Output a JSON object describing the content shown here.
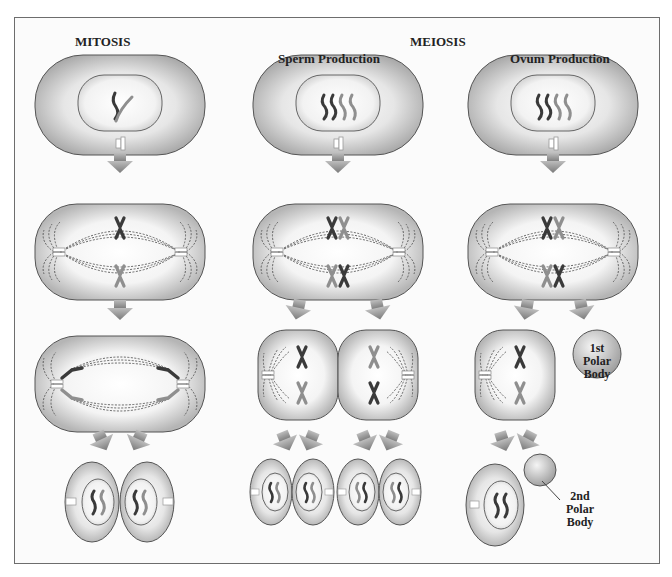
{
  "headers": {
    "mitosis": "MITOSIS",
    "meiosis": "MEIOSIS",
    "sperm": "Sperm Production",
    "ovum": "Ovum Production"
  },
  "labels": {
    "first_polar_body": [
      "1st",
      "Polar",
      "Body"
    ],
    "second_polar_body": [
      "2nd",
      "Polar",
      "Body"
    ]
  },
  "colors": {
    "border": "#6d6d6d",
    "cell_fill_edge": "#a8a8a8",
    "cell_fill_center": "#ffffff",
    "arrow": "#8a8a8a",
    "chromosome_dark": "#3a3a3a",
    "chromosome_light": "#8f8f8f"
  },
  "columns": [
    {
      "name": "mitosis",
      "stages": [
        "interphase",
        "metaphase",
        "anaphase",
        "daughter-cells x2"
      ]
    },
    {
      "name": "sperm-production",
      "stages": [
        "interphase",
        "metaphase I",
        "meiosis II cells x2",
        "spermatids x4"
      ]
    },
    {
      "name": "ovum-production",
      "stages": [
        "interphase",
        "metaphase I",
        "oocyte + 1st polar body",
        "ovum + 2nd polar body"
      ]
    }
  ]
}
